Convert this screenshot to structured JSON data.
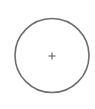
{
  "diagram": {
    "shape": "circle",
    "center": {
      "x": 52,
      "y": 55.5
    },
    "radius": 37,
    "stroke_color": "#6e6e6e",
    "stroke_width": 1.6,
    "center_marker": "plus",
    "marker_color": "#555555"
  }
}
